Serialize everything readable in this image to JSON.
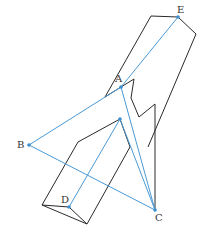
{
  "figure": {
    "type": "geometry-diagram",
    "colors": {
      "edges": "#2a2a2a",
      "construction_lines": "#4a9ad6",
      "points": "#3b8fd0",
      "labels": "#333333"
    },
    "points": [
      {
        "name": "A",
        "label": "A",
        "x": 121,
        "y": 87
      },
      {
        "name": "B",
        "label": "B",
        "x": 29,
        "y": 145
      },
      {
        "name": "C",
        "label": "C",
        "x": 155,
        "y": 210
      },
      {
        "name": "D",
        "label": "D",
        "x": 69,
        "y": 207
      },
      {
        "name": "E",
        "label": "E",
        "x": 178,
        "y": 17
      },
      {
        "name": "F",
        "label": "",
        "x": 120,
        "y": 119
      }
    ],
    "blue_segments": [
      [
        "A",
        "B"
      ],
      [
        "B",
        "C"
      ],
      [
        "A",
        "C"
      ],
      [
        "A",
        "E"
      ],
      [
        "D",
        "F"
      ],
      [
        "F",
        "C"
      ]
    ]
  }
}
